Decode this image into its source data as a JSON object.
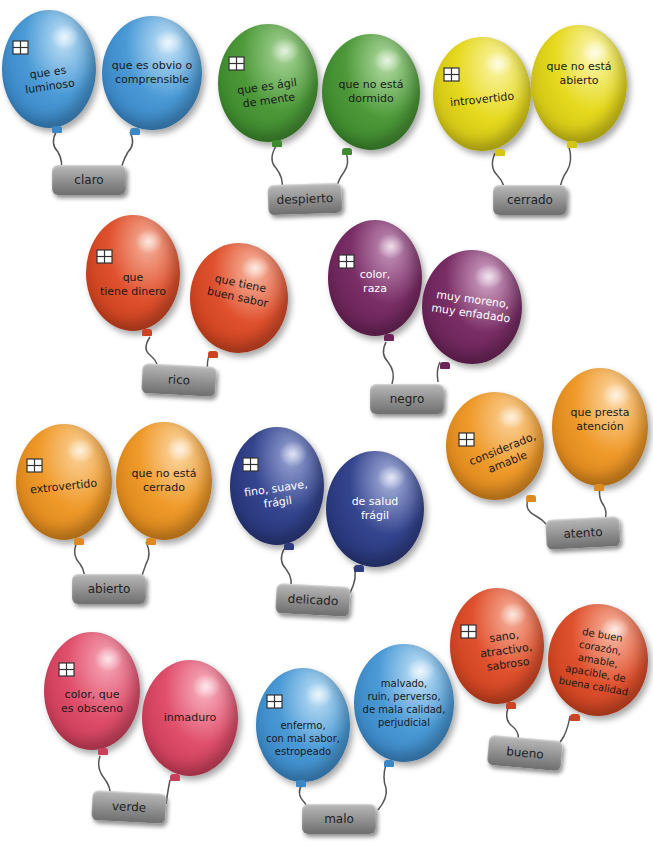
{
  "colors": {
    "blue": "#4a9ad6",
    "green": "#4e9a3a",
    "yellow": "#e6d91e",
    "red": "#e0512e",
    "purple": "#7a2e66",
    "orange": "#ef9a2a",
    "navy": "#34448e",
    "pink": "#e04f6c",
    "tag": "#8f8f8f"
  },
  "groups": [
    {
      "word": "claro",
      "balloons": [
        {
          "text": "que es\nluminoso",
          "color": "blue",
          "has_window_icon": true
        },
        {
          "text": "que es obvio o\ncomprensible",
          "color": "blue",
          "has_window_icon": false
        }
      ]
    },
    {
      "word": "despierto",
      "balloons": [
        {
          "text": "que es ágil\nde mente",
          "color": "green",
          "has_window_icon": true
        },
        {
          "text": "que no está\ndormido",
          "color": "green",
          "has_window_icon": false
        }
      ]
    },
    {
      "word": "cerrado",
      "balloons": [
        {
          "text": "introvertido",
          "color": "yellow",
          "has_window_icon": true
        },
        {
          "text": "que no está\nabierto",
          "color": "yellow",
          "has_window_icon": false
        }
      ]
    },
    {
      "word": "rico",
      "balloons": [
        {
          "text": "que\ntiene dinero",
          "color": "red",
          "has_window_icon": true
        },
        {
          "text": "que tiene\nbuen sabor",
          "color": "red",
          "has_window_icon": false
        }
      ]
    },
    {
      "word": "negro",
      "balloons": [
        {
          "text": "color,\nraza",
          "color": "purple",
          "has_window_icon": true
        },
        {
          "text": "muy moreno,\nmuy enfadado",
          "color": "purple",
          "has_window_icon": false
        }
      ]
    },
    {
      "word": "atento",
      "balloons": [
        {
          "text": "considerado,\namable",
          "color": "orange",
          "has_window_icon": true
        },
        {
          "text": "que presta\natención",
          "color": "orange",
          "has_window_icon": false
        }
      ]
    },
    {
      "word": "abierto",
      "balloons": [
        {
          "text": "extrovertido",
          "color": "orange",
          "has_window_icon": true
        },
        {
          "text": "que no está\ncerrado",
          "color": "orange",
          "has_window_icon": false
        }
      ]
    },
    {
      "word": "delicado",
      "balloons": [
        {
          "text": "fino, suave,\nfrágil",
          "color": "navy",
          "has_window_icon": true
        },
        {
          "text": "de salud\nfrágil",
          "color": "navy",
          "has_window_icon": false
        }
      ]
    },
    {
      "word": "bueno",
      "balloons": [
        {
          "text": "sano,\natractivo,\nsabroso",
          "color": "red",
          "has_window_icon": true
        },
        {
          "text": "de buen\ncorazón, amable,\napacible, de\nbuena calidad",
          "color": "red",
          "has_window_icon": false
        }
      ]
    },
    {
      "word": "verde",
      "balloons": [
        {
          "text": "color, que\nes obsceno",
          "color": "pink",
          "has_window_icon": true
        },
        {
          "text": "inmaduro",
          "color": "pink",
          "has_window_icon": false
        }
      ]
    },
    {
      "word": "malo",
      "balloons": [
        {
          "text": "enfermo,\ncon mal sabor,\nestropeado",
          "color": "blue",
          "has_window_icon": true
        },
        {
          "text": "malvado,\nruin, perverso,\nde mala calidad,\nperjudicial",
          "color": "blue",
          "has_window_icon": false
        }
      ]
    }
  ]
}
